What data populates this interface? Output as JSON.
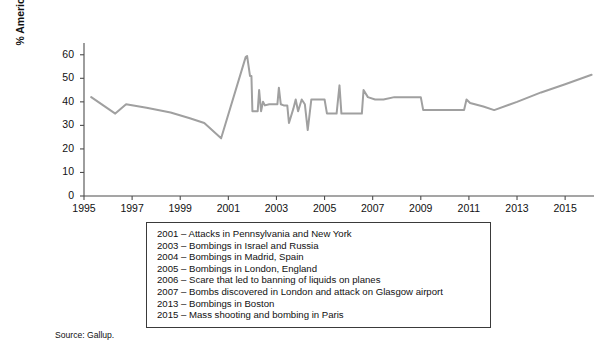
{
  "chart_data": {
    "type": "line",
    "title": "",
    "subtitle": "",
    "xlabel": "",
    "ylabel": "% Americans very/somewhat worried\nabout terrorism",
    "xlim": [
      1995,
      2016.2
    ],
    "ylim": [
      0,
      65
    ],
    "grid": false,
    "legend_position": "none",
    "line_color": "#a0a0a0",
    "axis_color": "#4d4d4d",
    "xticks": [
      1995,
      1997,
      1999,
      2001,
      2003,
      2005,
      2007,
      2009,
      2011,
      2013,
      2015
    ],
    "xticklabels": [
      "1995",
      "1997",
      "1999",
      "2001",
      "2003",
      "2005",
      "2007",
      "2009",
      "2011",
      "2013",
      "2015"
    ],
    "yticks": [
      0,
      10,
      20,
      30,
      40,
      50,
      60
    ],
    "yticklabels": [
      "0",
      "10",
      "20",
      "30",
      "40",
      "50",
      "60"
    ],
    "series": [
      {
        "name": "% Americans very/somewhat worried about terrorism",
        "points": [
          [
            1995.3,
            42.0
          ],
          [
            1996.3,
            35.0
          ],
          [
            1996.75,
            39.0
          ],
          [
            1997.6,
            37.5
          ],
          [
            1998.6,
            35.5
          ],
          [
            1999.4,
            33.0
          ],
          [
            2000.0,
            31.0
          ],
          [
            2000.7,
            24.5
          ],
          [
            2001.72,
            59.0
          ],
          [
            2001.78,
            59.5
          ],
          [
            2001.9,
            51.0
          ],
          [
            2001.96,
            51.0
          ],
          [
            2002.0,
            36.0
          ],
          [
            2002.22,
            36.0
          ],
          [
            2002.28,
            45.0
          ],
          [
            2002.36,
            36.0
          ],
          [
            2002.44,
            40.0
          ],
          [
            2002.52,
            38.5
          ],
          [
            2002.7,
            39.0
          ],
          [
            2002.95,
            39.0
          ],
          [
            2003.04,
            39.0
          ],
          [
            2003.1,
            46.0
          ],
          [
            2003.18,
            39.0
          ],
          [
            2003.3,
            38.5
          ],
          [
            2003.45,
            38.5
          ],
          [
            2003.52,
            31.0
          ],
          [
            2003.7,
            37.0
          ],
          [
            2003.8,
            41.0
          ],
          [
            2003.9,
            36.0
          ],
          [
            2004.05,
            41.0
          ],
          [
            2004.18,
            39.0
          ],
          [
            2004.3,
            28.0
          ],
          [
            2004.45,
            41.0
          ],
          [
            2004.6,
            41.0
          ],
          [
            2004.8,
            41.0
          ],
          [
            2005.0,
            41.0
          ],
          [
            2005.1,
            35.0
          ],
          [
            2005.35,
            35.0
          ],
          [
            2005.5,
            35.0
          ],
          [
            2005.62,
            47.0
          ],
          [
            2005.7,
            35.0
          ],
          [
            2005.8,
            35.0
          ],
          [
            2006.0,
            35.0
          ],
          [
            2006.3,
            35.0
          ],
          [
            2006.55,
            35.0
          ],
          [
            2006.62,
            45.0
          ],
          [
            2006.8,
            42.0
          ],
          [
            2007.1,
            41.0
          ],
          [
            2007.45,
            41.0
          ],
          [
            2007.9,
            42.0
          ],
          [
            2008.3,
            42.0
          ],
          [
            2008.8,
            42.0
          ],
          [
            2009.0,
            42.0
          ],
          [
            2009.1,
            36.5
          ],
          [
            2009.6,
            36.5
          ],
          [
            2010.1,
            36.5
          ],
          [
            2010.6,
            36.5
          ],
          [
            2010.8,
            36.5
          ],
          [
            2010.9,
            41.0
          ],
          [
            2011.05,
            39.5
          ],
          [
            2011.6,
            38.0
          ],
          [
            2012.05,
            36.5
          ],
          [
            2013.0,
            40.0
          ],
          [
            2014.0,
            44.0
          ],
          [
            2015.0,
            47.5
          ],
          [
            2016.1,
            51.5
          ]
        ]
      }
    ],
    "annotations": {
      "box_lines": [
        "2001 – Attacks in Pennsylvania and New York",
        "2003 – Bombings in Israel and Russia",
        "2004 – Bombings in Madrid, Spain",
        "2005 – Bombings in London, England",
        "2006 – Scare that led to banning of liquids on planes",
        "2007 – Bombs discovered in London and attack on Glasgow airport",
        "2013 – Bombings in Boston",
        "2015 – Mass shooting and bombing in Paris"
      ],
      "source": "Source: Gallup."
    }
  }
}
